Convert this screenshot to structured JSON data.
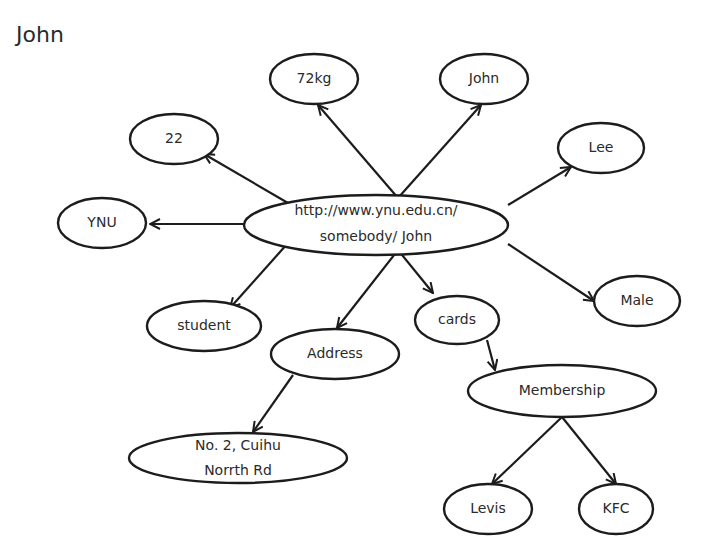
{
  "title": "John",
  "colors": {
    "stroke": "#1c1c1c",
    "text": "#2a2a2a",
    "background": "#ffffff"
  },
  "nodes": {
    "center": {
      "line1": "http://www.ynu.edu.cn/",
      "line2": "somebody/ John"
    },
    "age": "22",
    "weight": "72kg",
    "first_name": "John",
    "last_name": "Lee",
    "school": "YNU",
    "gender": "Male",
    "occupation": "student",
    "address": "Address",
    "address_value": {
      "line1": "No. 2, Cuihu",
      "line2": "Norrth Rd"
    },
    "cards": "cards",
    "membership": "Membership",
    "levis": "Levis",
    "kfc": "KFC"
  },
  "edges": [
    [
      "center",
      "age"
    ],
    [
      "center",
      "weight"
    ],
    [
      "center",
      "first_name"
    ],
    [
      "center",
      "last_name"
    ],
    [
      "center",
      "school"
    ],
    [
      "center",
      "gender"
    ],
    [
      "center",
      "occupation"
    ],
    [
      "center",
      "address"
    ],
    [
      "center",
      "cards"
    ],
    [
      "address",
      "address_value"
    ],
    [
      "cards",
      "membership"
    ],
    [
      "membership",
      "levis"
    ],
    [
      "membership",
      "kfc"
    ]
  ]
}
